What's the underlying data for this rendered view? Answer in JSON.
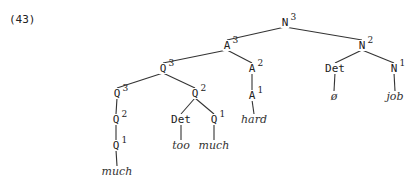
{
  "example_number": "(43)",
  "tree": {
    "nodes": [
      {
        "id": "n3",
        "cat": "N",
        "bar": "3",
        "x": 285,
        "y": 26
      },
      {
        "id": "a3",
        "cat": "A",
        "bar": "3",
        "x": 227,
        "y": 49
      },
      {
        "id": "n2",
        "cat": "N",
        "bar": "2",
        "x": 362,
        "y": 49
      },
      {
        "id": "q3top",
        "cat": "Q",
        "bar": "3",
        "x": 163,
        "y": 72
      },
      {
        "id": "a2",
        "cat": "A",
        "bar": "2",
        "x": 252,
        "y": 72
      },
      {
        "id": "det_np",
        "cat": "Det",
        "bar": "",
        "x": 335,
        "y": 72
      },
      {
        "id": "n1",
        "cat": "N",
        "bar": "1",
        "x": 394,
        "y": 72
      },
      {
        "id": "q3left",
        "cat": "Q",
        "bar": "3",
        "x": 117,
        "y": 97
      },
      {
        "id": "q2right",
        "cat": "Q",
        "bar": "2",
        "x": 195,
        "y": 97
      },
      {
        "id": "a1",
        "cat": "A",
        "bar": "1",
        "x": 252,
        "y": 99
      },
      {
        "id": "q2left",
        "cat": "Q",
        "bar": "2",
        "x": 116,
        "y": 123
      },
      {
        "id": "det_q",
        "cat": "Det",
        "bar": "",
        "x": 181,
        "y": 123
      },
      {
        "id": "q1right",
        "cat": "Q",
        "bar": "1",
        "x": 214,
        "y": 123
      },
      {
        "id": "q1left",
        "cat": "Q",
        "bar": "1",
        "x": 116,
        "y": 149
      }
    ],
    "leaves": [
      {
        "id": "w_job",
        "word": "job",
        "x": 395,
        "y": 100
      },
      {
        "id": "w_null",
        "word": "ø",
        "x": 334,
        "y": 100
      },
      {
        "id": "w_hard",
        "word": "hard",
        "x": 254,
        "y": 123
      },
      {
        "id": "w_too",
        "word": "too",
        "x": 181,
        "y": 149
      },
      {
        "id": "w_much2",
        "word": "much",
        "x": 214,
        "y": 149
      },
      {
        "id": "w_much1",
        "word": "much",
        "x": 117,
        "y": 175
      }
    ],
    "edges": [
      [
        "n3",
        "a3"
      ],
      [
        "n3",
        "n2"
      ],
      [
        "a3",
        "q3top"
      ],
      [
        "a3",
        "a2"
      ],
      [
        "n2",
        "det_np"
      ],
      [
        "n2",
        "n1"
      ],
      [
        "q3top",
        "q3left"
      ],
      [
        "q3top",
        "q2right"
      ],
      [
        "a2",
        "a1"
      ],
      [
        "q3left",
        "q2left"
      ],
      [
        "q2left",
        "q1left"
      ],
      [
        "q2right",
        "det_q"
      ],
      [
        "q2right",
        "q1right"
      ],
      [
        "n1",
        "w_job"
      ],
      [
        "det_np",
        "w_null"
      ],
      [
        "a1",
        "w_hard"
      ],
      [
        "det_q",
        "w_too"
      ],
      [
        "q1right",
        "w_much2"
      ],
      [
        "q1left",
        "w_much1"
      ]
    ]
  }
}
